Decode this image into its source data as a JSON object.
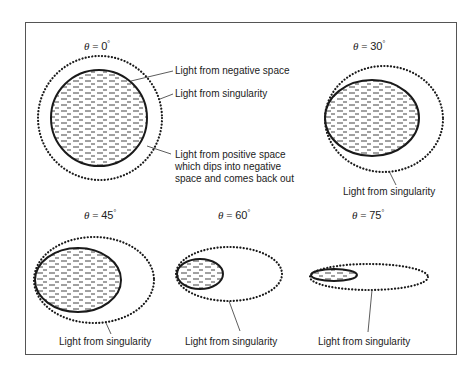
{
  "panels": [
    {
      "angle_symbol": "θ",
      "equals": " = ",
      "angle_value": "0",
      "degree": "°",
      "labels": {
        "negative_space": "Light from negative space",
        "singularity": "Light from singularity",
        "positive_space_line1": "Light from positive space",
        "positive_space_line2": "which dips into negative",
        "positive_space_line3": "space and comes back out"
      }
    },
    {
      "angle_symbol": "θ",
      "equals": " = ",
      "angle_value": "30",
      "degree": "°",
      "labels": {
        "singularity": "Light from singularity"
      }
    },
    {
      "angle_symbol": "θ",
      "equals": " = ",
      "angle_value": "45",
      "degree": "°",
      "labels": {
        "singularity": "Light from singularity"
      }
    },
    {
      "angle_symbol": "θ",
      "equals": " = ",
      "angle_value": "60",
      "degree": "°",
      "labels": {
        "singularity": "Light from singularity"
      }
    },
    {
      "angle_symbol": "θ",
      "equals": " = ",
      "angle_value": "75",
      "degree": "°",
      "labels": {
        "singularity": "Light from singularity"
      }
    }
  ],
  "colors": {
    "stroke": "#1a1a1a",
    "hatch": "#444444",
    "frame": "#555555"
  }
}
